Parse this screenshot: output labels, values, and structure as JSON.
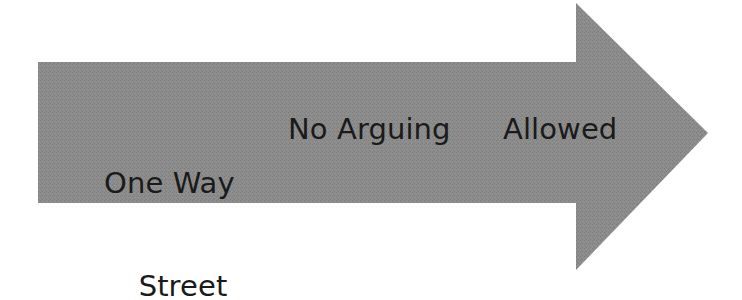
{
  "graphic": {
    "type": "right-pointing-block-arrow",
    "fill_color": "#8b8b8b",
    "background_color": "#ffffff",
    "text_color": "#1a1a1a",
    "geometry": {
      "shaft_left_x": 38,
      "shaft_top_y": 62,
      "shaft_bottom_y": 203,
      "shaft_right_x": 576,
      "head_top_y": 3,
      "head_bottom_y": 270,
      "tip_x": 708,
      "tip_y": 133
    }
  },
  "labels": {
    "segment_1": {
      "line_1": "One Way",
      "line_2": "Street"
    },
    "segment_2": "No Arguing",
    "segment_3": "Allowed"
  },
  "full_message": "One Way Street No Arguing Allowed"
}
